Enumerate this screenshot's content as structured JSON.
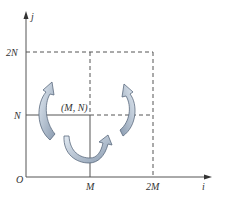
{
  "diagram": {
    "axes": {
      "x_label": "i",
      "y_label": "j",
      "origin_label": "O"
    },
    "ticks": {
      "x": [
        "M",
        "2M"
      ],
      "y": [
        "N",
        "2N"
      ]
    },
    "point_label": "(M, N)",
    "arrows": [
      {
        "name": "left-flip-arrow",
        "direction": "up-curve-left"
      },
      {
        "name": "right-flip-arrow",
        "direction": "up-curve-right"
      },
      {
        "name": "bottom-flip-arrow",
        "direction": "u-turn"
      }
    ],
    "colors": {
      "axis": "#555555",
      "dashed": "#555555",
      "arrow_fill_light": "#d6e2ee",
      "arrow_fill_dark": "#8a9bb0",
      "arrow_stroke": "#5a6a7e"
    }
  }
}
